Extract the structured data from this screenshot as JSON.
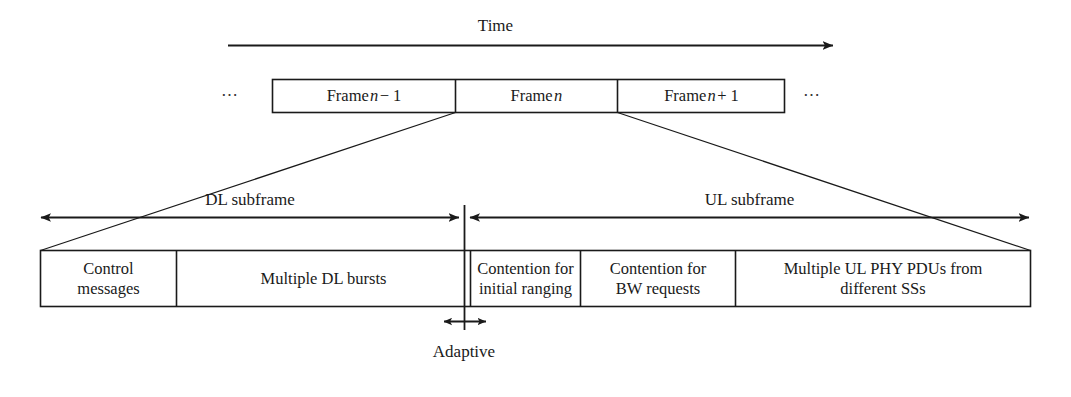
{
  "figure": {
    "title_axis_label": "Time",
    "ellipsis_left": "⋯",
    "ellipsis_right": "⋯"
  },
  "frames": {
    "items": [
      {
        "prefix": "Frame",
        "var": "n",
        "suffix": "− 1",
        "label": "Frame n − 1"
      },
      {
        "prefix": "Frame",
        "var": "n",
        "suffix": "",
        "label": "Frame n"
      },
      {
        "prefix": "Frame",
        "var": "n",
        "suffix": "+ 1",
        "label": "Frame n + 1"
      }
    ]
  },
  "subframes": {
    "downlink_label": "DL subframe",
    "uplink_label": "UL subframe"
  },
  "adaptive": {
    "label": "Adaptive"
  },
  "frame_detail": {
    "cells": [
      {
        "id": "control-messages",
        "lines": [
          "Control",
          "messages"
        ],
        "text": "Control messages"
      },
      {
        "id": "multiple-dl-bursts",
        "lines": [
          "Multiple DL bursts"
        ],
        "text": "Multiple DL bursts"
      },
      {
        "id": "contention-ranging",
        "lines": [
          "Contention for",
          "initial ranging"
        ],
        "text": "Contention for initial ranging"
      },
      {
        "id": "contention-bw",
        "lines": [
          "Contention for",
          "BW requests"
        ],
        "text": "Contention for BW requests"
      },
      {
        "id": "multiple-ul-pdus",
        "lines": [
          "Multiple UL PHY PDUs from",
          "different SSs"
        ],
        "text": "Multiple UL PHY PDUs from different SSs"
      }
    ]
  },
  "colors": {
    "line": "#1a1a1a",
    "background": "#ffffff",
    "text": "#1a1a1a"
  }
}
